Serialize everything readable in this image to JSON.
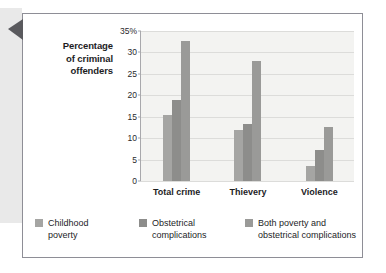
{
  "figure": {
    "pointer_icon": "left-triangle-marker"
  },
  "chart_data": {
    "type": "bar",
    "title": "",
    "xlabel": "",
    "ylabel": "Percentage of criminal offenders",
    "ylabel_lines": [
      "Percentage",
      "of criminal",
      "offenders"
    ],
    "categories": [
      "Total crime",
      "Thievery",
      "Violence"
    ],
    "series": [
      {
        "name": "Childhood poverty",
        "name_lines": [
          "Childhood",
          "poverty"
        ],
        "color": "#a5a5a3",
        "values": [
          15.5,
          12.0,
          3.5
        ]
      },
      {
        "name": "Obstetrical complications",
        "name_lines": [
          "Obstetrical",
          "complications"
        ],
        "color": "#8d8d8b",
        "values": [
          19.0,
          13.2,
          7.3
        ]
      },
      {
        "name": "Both poverty and obstetrical complications",
        "name_lines": [
          "Both poverty and",
          "obstetrical complications"
        ],
        "color": "#9a9a98",
        "values": [
          32.7,
          28.0,
          12.5
        ]
      }
    ],
    "ylim": [
      0,
      35
    ],
    "ytick_values": [
      0,
      5,
      10,
      15,
      20,
      25,
      30,
      35
    ],
    "ytick_labels": [
      "0",
      "5",
      "10",
      "15",
      "20",
      "25",
      "30",
      "35%"
    ],
    "grid": true,
    "legend_position": "bottom"
  }
}
